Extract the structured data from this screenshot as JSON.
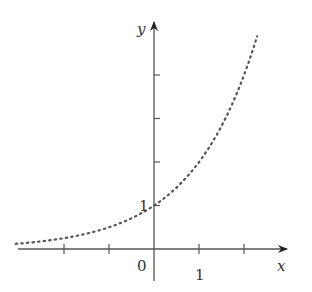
{
  "chart_data": {
    "type": "line",
    "title": "",
    "xlabel": "x",
    "ylabel": "y",
    "function": "y = 2^x",
    "line_style": "dotted",
    "x": [
      -3.1,
      -3,
      -2.5,
      -2,
      -1.5,
      -1,
      -0.5,
      0,
      0.5,
      1,
      1.5,
      2,
      2.3
    ],
    "y": [
      0.117,
      0.125,
      0.177,
      0.25,
      0.354,
      0.5,
      0.707,
      1,
      1.414,
      2,
      2.828,
      4,
      4.925
    ],
    "xlim": [
      -3.2,
      2.8
    ],
    "ylim": [
      -0.6,
      5.1
    ],
    "x_ticks": [
      -2,
      -1,
      0,
      1,
      2
    ],
    "y_ticks": [
      1,
      2,
      3,
      4
    ],
    "x_tick_labels": {
      "origin": "0",
      "one": "1"
    },
    "y_tick_labels": {
      "one": "1"
    },
    "grid": false
  },
  "labels": {
    "x_axis": "x",
    "y_axis": "y",
    "origin": "0",
    "x_one": "1",
    "y_one": "1"
  },
  "colors": {
    "axis": "#555555",
    "curve": "#555555",
    "text": "#333333"
  }
}
